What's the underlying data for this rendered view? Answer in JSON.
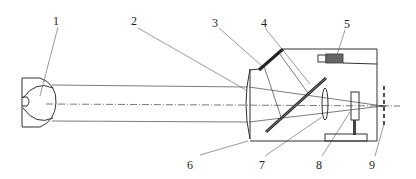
{
  "diagram": {
    "type": "optical-system-schematic",
    "labels": [
      {
        "id": "1",
        "text": "1",
        "x": 56,
        "y": 25
      },
      {
        "id": "2",
        "text": "2",
        "x": 134,
        "y": 25
      },
      {
        "id": "3",
        "text": "3",
        "x": 215,
        "y": 26
      },
      {
        "id": "4",
        "text": "4",
        "x": 263,
        "y": 26
      },
      {
        "id": "5",
        "text": "5",
        "x": 346,
        "y": 27
      },
      {
        "id": "6",
        "text": "6",
        "x": 190,
        "y": 168
      },
      {
        "id": "7",
        "text": "7",
        "x": 259,
        "y": 168
      },
      {
        "id": "8",
        "text": "8",
        "x": 318,
        "y": 168
      },
      {
        "id": "9",
        "text": "9",
        "x": 372,
        "y": 168
      }
    ],
    "colors": {
      "line": "#333333",
      "component_dark": "#555555",
      "background": "#ffffff"
    }
  }
}
